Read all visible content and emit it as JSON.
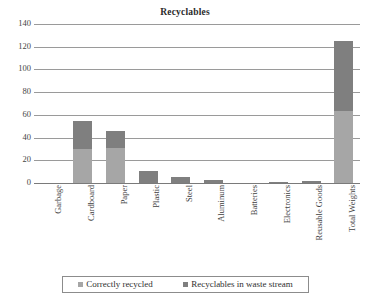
{
  "chart_data": {
    "type": "bar",
    "subtype": "stacked-column",
    "title": "Recyclables",
    "xlabel": "",
    "ylabel": "",
    "ylim": [
      0,
      140
    ],
    "ytick_step": 20,
    "yticks": [
      "140",
      "120",
      "100",
      "80",
      "60",
      "40",
      "20",
      "0"
    ],
    "grid": true,
    "legend_position": "bottom",
    "categories": [
      "Garbage",
      "Cardboard",
      "Paper",
      "Plastic",
      "Steel",
      "Aluminum",
      "Batteries",
      "Electronics",
      "Reusable Goods",
      "Total Weights"
    ],
    "series": [
      {
        "name": "Correctly recycled",
        "color": "#a6a6a6",
        "values": [
          0,
          30,
          31,
          0,
          0,
          0,
          0,
          0,
          0,
          63
        ]
      },
      {
        "name": "Recyclables in waste stream",
        "color": "#7f7f7f",
        "values": [
          0,
          25,
          15,
          11,
          5,
          3,
          0,
          1,
          1.5,
          62
        ]
      }
    ],
    "totals": [
      0,
      55,
      46,
      11,
      5,
      3,
      0,
      1,
      1.5,
      125
    ]
  },
  "legend": {
    "items": [
      {
        "label": "Correctly recycled",
        "color": "#a6a6a6"
      },
      {
        "label": "Recyclables in waste stream",
        "color": "#7f7f7f"
      }
    ]
  }
}
